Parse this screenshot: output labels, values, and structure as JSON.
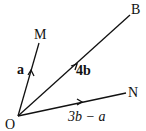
{
  "points": {
    "O": "O",
    "M": "M",
    "B": "B",
    "N": "N"
  },
  "vectors": {
    "OM": "a",
    "OB": "4b",
    "ON": "3b − a"
  }
}
